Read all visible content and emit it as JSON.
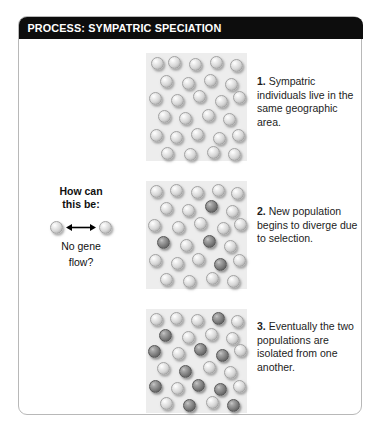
{
  "figure": {
    "title": "PROCESS: SYMPATRIC SPECIATION",
    "title_bar_color": "#0d0d0d",
    "title_text_color": "#ffffff",
    "card_border_color": "#b8b8b8",
    "panel_background": "#ededed",
    "page_background": "#ffffff"
  },
  "annotation": {
    "name": "gene-flow-question",
    "line_top": "How can",
    "line_top_2": "this be:",
    "line_bottom": "No gene",
    "line_bottom_2": "flow?",
    "arrow_icon": "double-headed-arrow-icon",
    "left_organism": "light-sphere-icon",
    "right_organism": "light-sphere-icon"
  },
  "steps": [
    {
      "number": "1.",
      "text": " Sympatric individuals live in the same geographic area.",
      "panel_name": "population-panel-1"
    },
    {
      "number": "2.",
      "text": " New population begins to diverge due to selection.",
      "panel_name": "population-panel-2"
    },
    {
      "number": "3.",
      "text": " Eventually the two populations are isolated from one another.",
      "panel_name": "population-panel-3"
    }
  ],
  "chart_data": {
    "type": "scatter",
    "title": "PROCESS: SYMPATRIC SPECIATION",
    "xlabel": "",
    "ylabel": "",
    "legend": [
      "light morph (ancestral)",
      "dark morph (diverged)"
    ],
    "colors": {
      "light_morph": "#d6d6d6",
      "dark_morph": "#7d7d7d",
      "panel_background": "#ededed"
    },
    "panels": [
      {
        "label": "1",
        "light_count": 26,
        "dark_count": 0,
        "points": [
          {
            "x": 5,
            "y": 4,
            "morph": "light"
          },
          {
            "x": 22,
            "y": 3,
            "morph": "light"
          },
          {
            "x": 43,
            "y": 5,
            "morph": "light"
          },
          {
            "x": 63,
            "y": 3,
            "morph": "light"
          },
          {
            "x": 83,
            "y": 6,
            "morph": "light"
          },
          {
            "x": 14,
            "y": 20,
            "morph": "light"
          },
          {
            "x": 36,
            "y": 22,
            "morph": "light"
          },
          {
            "x": 57,
            "y": 19,
            "morph": "light"
          },
          {
            "x": 78,
            "y": 23,
            "morph": "light"
          },
          {
            "x": 3,
            "y": 36,
            "morph": "light"
          },
          {
            "x": 25,
            "y": 38,
            "morph": "light"
          },
          {
            "x": 47,
            "y": 34,
            "morph": "light"
          },
          {
            "x": 68,
            "y": 39,
            "morph": "light"
          },
          {
            "x": 86,
            "y": 35,
            "morph": "light"
          },
          {
            "x": 12,
            "y": 53,
            "morph": "light"
          },
          {
            "x": 33,
            "y": 55,
            "morph": "light"
          },
          {
            "x": 55,
            "y": 52,
            "morph": "light"
          },
          {
            "x": 76,
            "y": 56,
            "morph": "light"
          },
          {
            "x": 4,
            "y": 70,
            "morph": "light"
          },
          {
            "x": 24,
            "y": 72,
            "morph": "light"
          },
          {
            "x": 45,
            "y": 69,
            "morph": "light"
          },
          {
            "x": 66,
            "y": 73,
            "morph": "light"
          },
          {
            "x": 85,
            "y": 70,
            "morph": "light"
          },
          {
            "x": 15,
            "y": 87,
            "morph": "light"
          },
          {
            "x": 38,
            "y": 88,
            "morph": "light"
          },
          {
            "x": 60,
            "y": 86,
            "morph": "light"
          },
          {
            "x": 81,
            "y": 88,
            "morph": "light"
          }
        ]
      },
      {
        "label": "2",
        "light_count": 21,
        "dark_count": 6,
        "points": [
          {
            "x": 4,
            "y": 4,
            "morph": "light"
          },
          {
            "x": 24,
            "y": 3,
            "morph": "light"
          },
          {
            "x": 45,
            "y": 5,
            "morph": "light"
          },
          {
            "x": 65,
            "y": 3,
            "morph": "light"
          },
          {
            "x": 84,
            "y": 6,
            "morph": "light"
          },
          {
            "x": 14,
            "y": 19,
            "morph": "light"
          },
          {
            "x": 36,
            "y": 21,
            "morph": "light"
          },
          {
            "x": 58,
            "y": 18,
            "morph": "dark"
          },
          {
            "x": 79,
            "y": 22,
            "morph": "light"
          },
          {
            "x": 2,
            "y": 35,
            "morph": "light"
          },
          {
            "x": 26,
            "y": 37,
            "morph": "light"
          },
          {
            "x": 48,
            "y": 33,
            "morph": "light"
          },
          {
            "x": 70,
            "y": 38,
            "morph": "light"
          },
          {
            "x": 87,
            "y": 34,
            "morph": "light"
          },
          {
            "x": 11,
            "y": 51,
            "morph": "dark"
          },
          {
            "x": 34,
            "y": 54,
            "morph": "light"
          },
          {
            "x": 56,
            "y": 50,
            "morph": "dark"
          },
          {
            "x": 77,
            "y": 55,
            "morph": "light"
          },
          {
            "x": 3,
            "y": 68,
            "morph": "light"
          },
          {
            "x": 25,
            "y": 70,
            "morph": "light"
          },
          {
            "x": 46,
            "y": 67,
            "morph": "light"
          },
          {
            "x": 67,
            "y": 71,
            "morph": "dark"
          },
          {
            "x": 86,
            "y": 68,
            "morph": "light"
          },
          {
            "x": 14,
            "y": 85,
            "morph": "light"
          },
          {
            "x": 37,
            "y": 87,
            "morph": "light"
          },
          {
            "x": 59,
            "y": 84,
            "morph": "light"
          },
          {
            "x": 80,
            "y": 87,
            "morph": "light"
          }
        ]
      },
      {
        "label": "3",
        "light_count": 15,
        "dark_count": 12,
        "points": [
          {
            "x": 4,
            "y": 4,
            "morph": "light"
          },
          {
            "x": 24,
            "y": 3,
            "morph": "light"
          },
          {
            "x": 45,
            "y": 5,
            "morph": "light"
          },
          {
            "x": 65,
            "y": 3,
            "morph": "dark"
          },
          {
            "x": 84,
            "y": 6,
            "morph": "light"
          },
          {
            "x": 13,
            "y": 19,
            "morph": "dark"
          },
          {
            "x": 36,
            "y": 21,
            "morph": "light"
          },
          {
            "x": 58,
            "y": 18,
            "morph": "light"
          },
          {
            "x": 79,
            "y": 22,
            "morph": "light"
          },
          {
            "x": 2,
            "y": 35,
            "morph": "dark"
          },
          {
            "x": 26,
            "y": 37,
            "morph": "light"
          },
          {
            "x": 48,
            "y": 33,
            "morph": "dark"
          },
          {
            "x": 69,
            "y": 38,
            "morph": "dark"
          },
          {
            "x": 87,
            "y": 34,
            "morph": "light"
          },
          {
            "x": 11,
            "y": 51,
            "morph": "light"
          },
          {
            "x": 33,
            "y": 54,
            "morph": "dark"
          },
          {
            "x": 56,
            "y": 50,
            "morph": "light"
          },
          {
            "x": 77,
            "y": 55,
            "morph": "light"
          },
          {
            "x": 3,
            "y": 68,
            "morph": "dark"
          },
          {
            "x": 25,
            "y": 70,
            "morph": "light"
          },
          {
            "x": 46,
            "y": 67,
            "morph": "dark"
          },
          {
            "x": 67,
            "y": 71,
            "morph": "dark"
          },
          {
            "x": 86,
            "y": 68,
            "morph": "light"
          },
          {
            "x": 14,
            "y": 85,
            "morph": "light"
          },
          {
            "x": 37,
            "y": 87,
            "morph": "dark"
          },
          {
            "x": 59,
            "y": 84,
            "morph": "light"
          },
          {
            "x": 80,
            "y": 87,
            "morph": "dark"
          }
        ]
      }
    ]
  }
}
